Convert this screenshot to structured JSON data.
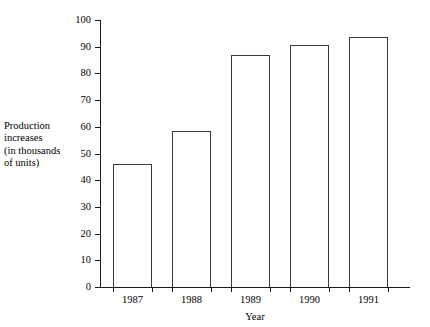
{
  "chart_data": {
    "type": "bar",
    "title": "",
    "subtitle": "",
    "categories": [
      "1987",
      "1988",
      "1989",
      "1990",
      "1991"
    ],
    "values": [
      46,
      58.5,
      87,
      90.5,
      93.5
    ],
    "xlabel": "Year",
    "ylabel": "Production increases (in thousands of units)",
    "ylabel_lines": [
      "Production",
      "increases",
      "(in thousands",
      "of units)"
    ],
    "ylim": [
      0,
      100
    ],
    "ytick_values": [
      0,
      10,
      20,
      30,
      40,
      50,
      60,
      70,
      80,
      90,
      100
    ],
    "ytick_labels": [
      "0",
      "10",
      "20",
      "30",
      "40",
      "50",
      "60",
      "70",
      "80",
      "90",
      "100"
    ],
    "grid": false,
    "legend": false,
    "legend_position": "none",
    "bar_fill_color": "#ffffff",
    "bar_outline_color": "#3a3a3a",
    "axis_color": "#1a1a1a",
    "background_color": "#ffffff"
  }
}
